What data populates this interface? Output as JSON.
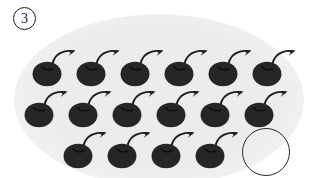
{
  "illustration": {
    "item_label": "3",
    "kind": "counting-worksheet-cherries",
    "cherry_color": "#262626",
    "outline_color": "#2a2a2a",
    "backdrop_color": "#ececec",
    "page_background": "#ffffff",
    "total_cherries": 16,
    "empty_outline_count": 1,
    "rows": [
      {
        "name": "row-1",
        "count": 6,
        "top": 44,
        "cherries": [
          {
            "x": 31,
            "y": 44
          },
          {
            "x": 75,
            "y": 44
          },
          {
            "x": 119,
            "y": 44
          },
          {
            "x": 163,
            "y": 44
          },
          {
            "x": 207,
            "y": 44
          },
          {
            "x": 251,
            "y": 44
          }
        ]
      },
      {
        "name": "row-2",
        "count": 6,
        "top": 85,
        "cherries": [
          {
            "x": 23,
            "y": 85
          },
          {
            "x": 67,
            "y": 85
          },
          {
            "x": 111,
            "y": 85
          },
          {
            "x": 155,
            "y": 85
          },
          {
            "x": 199,
            "y": 85
          },
          {
            "x": 243,
            "y": 85
          }
        ]
      },
      {
        "name": "row-3",
        "count": 4,
        "top": 126,
        "cherries": [
          {
            "x": 62,
            "y": 126
          },
          {
            "x": 106,
            "y": 126
          },
          {
            "x": 150,
            "y": 126
          },
          {
            "x": 194,
            "y": 126
          }
        ]
      }
    ],
    "empty_circle": {
      "x": 242,
      "y": 128,
      "size": 48
    }
  }
}
